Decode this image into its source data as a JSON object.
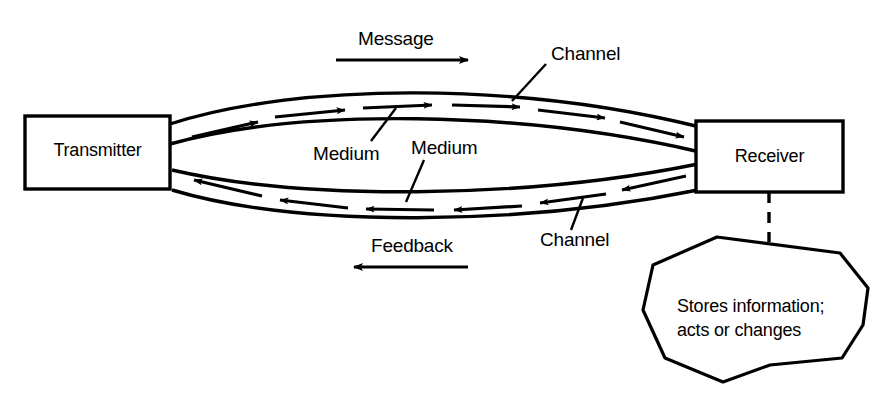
{
  "diagram": {
    "colors": {
      "stroke": "#000000",
      "background": "#ffffff",
      "text": "#000000"
    },
    "nodes": {
      "transmitter": {
        "label": "Transmitter"
      },
      "receiver": {
        "label": "Receiver"
      },
      "outcome": {
        "line1": "Stores information;",
        "line2": "acts or changes"
      }
    },
    "flow_labels": {
      "message": "Message",
      "feedback": "Feedback"
    },
    "annotations": {
      "channel_top": "Channel",
      "channel_bottom": "Channel",
      "medium_top": "Medium",
      "medium_bottom": "Medium"
    }
  }
}
